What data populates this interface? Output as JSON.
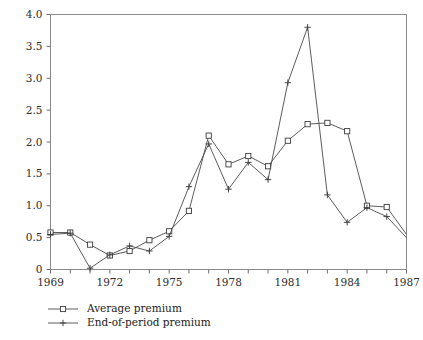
{
  "chart_data": {
    "type": "line",
    "title": "",
    "subtitle": "",
    "xlabel": "",
    "ylabel": "",
    "xlim": [
      1969,
      1987
    ],
    "ylim": [
      0,
      4.0
    ],
    "grid": false,
    "legend_position": "below-left",
    "x_ticks": [
      1969,
      1970,
      1971,
      1972,
      1973,
      1974,
      1975,
      1976,
      1977,
      1978,
      1979,
      1980,
      1981,
      1982,
      1983,
      1984,
      1985,
      1986,
      1987
    ],
    "x_tick_labels": [
      "1969",
      "",
      "",
      "1972",
      "",
      "",
      "1975",
      "",
      "",
      "1978",
      "",
      "",
      "1981",
      "",
      "",
      "1984",
      "",
      "",
      "1987"
    ],
    "y_ticks": [
      0,
      0.5,
      1.0,
      1.5,
      2.0,
      2.5,
      3.0,
      3.5,
      4.0
    ],
    "y_tick_labels": [
      "0",
      "0.5",
      "1.0",
      "1.5",
      "2.0",
      "2.5",
      "3.0",
      "3.5",
      "4.0"
    ],
    "x": [
      1969,
      1970,
      1971,
      1972,
      1973,
      1974,
      1975,
      1976,
      1977,
      1978,
      1979,
      1980,
      1981,
      1982,
      1983,
      1984,
      1985,
      1986,
      1987
    ],
    "series": [
      {
        "name": "Average premium",
        "marker": "square",
        "color": "#3c3c3c",
        "values": [
          0.58,
          0.58,
          0.39,
          0.22,
          0.29,
          0.46,
          0.6,
          0.92,
          2.1,
          1.65,
          1.78,
          1.62,
          2.02,
          2.28,
          2.3,
          2.17,
          1.0,
          0.98,
          0.55
        ],
        "marker_at_last_point": false
      },
      {
        "name": "End-of-period premium",
        "marker": "plus",
        "color": "#3c3c3c",
        "values": [
          0.55,
          0.57,
          0.02,
          0.23,
          0.37,
          0.29,
          0.52,
          1.3,
          1.97,
          1.26,
          1.68,
          1.41,
          2.93,
          3.8,
          1.17,
          0.74,
          0.97,
          0.83,
          0.5
        ],
        "marker_at_last_point": false
      }
    ]
  },
  "legend": {
    "entries": [
      {
        "label": "Average premium",
        "marker": "square"
      },
      {
        "label": "End-of-period premium",
        "marker": "plus"
      }
    ]
  }
}
